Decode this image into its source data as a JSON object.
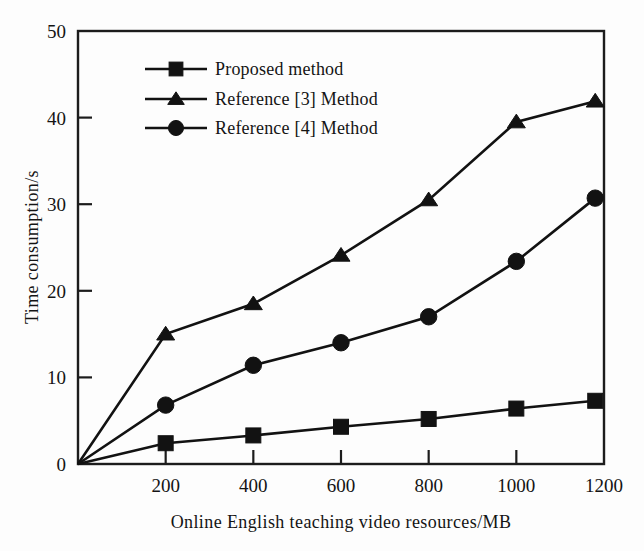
{
  "chart_data": {
    "type": "line",
    "title": "",
    "xlabel": "Online English teaching video resources/MB",
    "ylabel": "Time consumption/s",
    "xlim": [
      0,
      1200
    ],
    "ylim": [
      0,
      50
    ],
    "xticks": [
      200,
      400,
      600,
      800,
      1000,
      1200
    ],
    "yticks": [
      0,
      10,
      20,
      30,
      40,
      50
    ],
    "xtick_labels": [
      "200",
      "400",
      "600",
      "800",
      "1000",
      "1200"
    ],
    "ytick_labels": [
      "0",
      "10",
      "20",
      "30",
      "40",
      "50"
    ],
    "grid": false,
    "legend_position": "upper-left-inside",
    "x": [
      0,
      200,
      400,
      600,
      800,
      1000,
      1180
    ],
    "series": [
      {
        "name": "Proposed method",
        "marker": "square",
        "values": [
          0,
          2.4,
          3.3,
          4.3,
          5.2,
          6.4,
          7.3
        ]
      },
      {
        "name": "Reference [3] Method",
        "marker": "triangle",
        "values": [
          0,
          15.0,
          18.5,
          24.1,
          30.5,
          39.5,
          41.9
        ]
      },
      {
        "name": "Reference [4] Method",
        "marker": "circle",
        "values": [
          0,
          6.8,
          11.4,
          14.0,
          17.0,
          23.4,
          30.7
        ]
      }
    ]
  },
  "legend": {
    "entries": [
      {
        "label": "Proposed method",
        "marker": "square"
      },
      {
        "label": "Reference [3] Method",
        "marker": "triangle"
      },
      {
        "label": "Reference [4] Method",
        "marker": "circle"
      }
    ]
  },
  "colors": {
    "ink": "#121212",
    "frame": "#1c1c1c",
    "background": "#fdfdfd"
  }
}
